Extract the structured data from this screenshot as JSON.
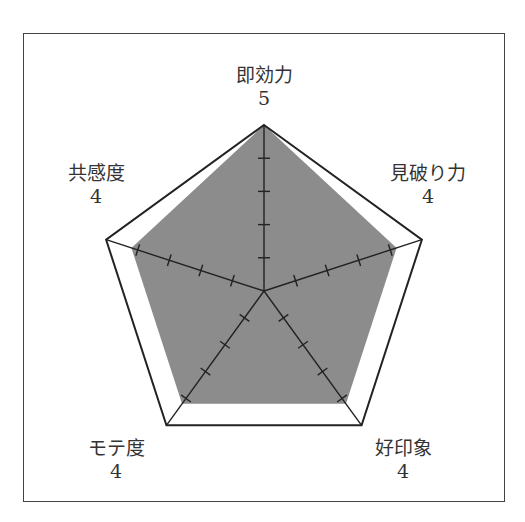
{
  "chart_data": {
    "type": "radar",
    "title": "",
    "categories": [
      "即効力",
      "見破り力",
      "好印象",
      "モテ度",
      "共感度"
    ],
    "values": [
      5,
      4,
      4,
      4,
      4
    ],
    "value_labels": [
      "5",
      "4",
      "4",
      "4",
      "4"
    ],
    "range": [
      0,
      5
    ],
    "ticks": [
      1,
      2,
      3,
      4
    ],
    "grid": "outer pentagon only, tick marks on axes",
    "fill_color": "#8c8c8c",
    "line_color": "#222222",
    "legend": null
  },
  "labels": {
    "top": {
      "name": "即効力",
      "value": "5"
    },
    "right": {
      "name": "見破り力",
      "value": "4"
    },
    "bottom_right": {
      "name": "好印象",
      "value": "4"
    },
    "bottom_left": {
      "name": "モテ度",
      "value": "4"
    },
    "left": {
      "name": "共感度",
      "value": "4"
    }
  }
}
